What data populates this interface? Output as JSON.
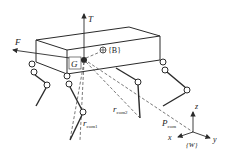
{
  "figure": {
    "labels": {
      "thrust": "T",
      "force": "F",
      "com_point": "G",
      "body_frame": "{B}",
      "r_com1_main": "r",
      "r_com1_sub": "com1",
      "r_com2_main": "r",
      "r_com2_sub": "com2",
      "p_com_main": "P",
      "p_com_sub": "com",
      "world_frame": "{W}",
      "axis_x": "x",
      "axis_y": "y",
      "axis_z": "z"
    },
    "colors": {
      "stroke": "#2a2a2a",
      "dash": "#555555",
      "background": "#ffffff"
    }
  }
}
